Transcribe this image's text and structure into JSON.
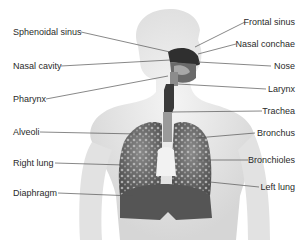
{
  "diagram": {
    "labels_left": [
      {
        "id": "sphenoidal-sinus",
        "text": "Sphenoidal sinus",
        "x": 13,
        "y": 27
      },
      {
        "id": "nasal-cavity",
        "text": "Nasal cavity",
        "x": 13,
        "y": 61
      },
      {
        "id": "pharynx",
        "text": "Pharynx",
        "x": 13,
        "y": 94
      },
      {
        "id": "alveoli",
        "text": "Alveoli",
        "x": 13,
        "y": 127
      },
      {
        "id": "right-lung",
        "text": "Right lung",
        "x": 13,
        "y": 158
      },
      {
        "id": "diaphragm",
        "text": "Diaphragm",
        "x": 13,
        "y": 188
      }
    ],
    "labels_right": [
      {
        "id": "frontal-sinus",
        "text": "Frontal sinus",
        "right": 7,
        "y": 17
      },
      {
        "id": "nasal-conchae",
        "text": "Nasal conchae",
        "right": 7,
        "y": 39
      },
      {
        "id": "nose",
        "text": "Nose",
        "right": 7,
        "y": 61
      },
      {
        "id": "larynx",
        "text": "Larynx",
        "right": 7,
        "y": 84
      },
      {
        "id": "trachea",
        "text": "Trachea",
        "right": 7,
        "y": 106
      },
      {
        "id": "bronchus",
        "text": "Bronchus",
        "right": 7,
        "y": 128
      },
      {
        "id": "bronchioles",
        "text": "Bronchioles",
        "right": 7,
        "y": 155
      },
      {
        "id": "left-lung",
        "text": "Left lung",
        "right": 7,
        "y": 182
      }
    ],
    "colors": {
      "body_fill": "#e8e8e8",
      "body_shade": "#d2d2d2",
      "lung_fill": "#6e6e6e",
      "lung_texture": "#b8b8b8",
      "diaphragm_fill": "#555555",
      "airway_dark": "#3a3a3a",
      "leader_line": "#555555",
      "label_text": "#2a2a2a"
    }
  }
}
